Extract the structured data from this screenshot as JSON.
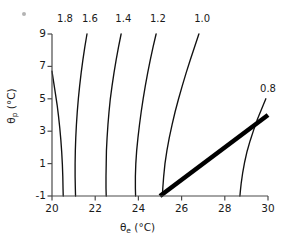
{
  "figure": {
    "background": "#ffffff",
    "line_color": "#111111",
    "axis_color": "#4a4a4a",
    "thick_line_color": "#000000",
    "artifact": {
      "name": "speck",
      "x": 22,
      "y": 12
    }
  },
  "axes": {
    "x": {
      "label_theta": "θ",
      "label_sub": "e",
      "label_unit": "(°C)",
      "ticks": [
        20,
        22,
        24,
        26,
        28,
        30
      ],
      "tick_labels": [
        "20",
        "22",
        "24",
        "26",
        "28",
        "30"
      ],
      "min": 20,
      "max": 30
    },
    "y": {
      "label_theta": "θ",
      "label_sub": "p",
      "label_unit": "(°C)",
      "ticks": [
        -1,
        1,
        3,
        5,
        7,
        9
      ],
      "tick_labels": [
        "-1",
        "1",
        "3",
        "5",
        "7",
        "9"
      ],
      "min": -1,
      "max": 9
    }
  },
  "chart_data": {
    "type": "line",
    "title": "",
    "xlabel": "θe (°C)",
    "ylabel": "θp (°C)",
    "xlim": [
      20,
      30
    ],
    "ylim": [
      -1,
      9
    ],
    "grid": false,
    "legend": "inline-contour-labels",
    "xticks": [
      20,
      22,
      24,
      26,
      28,
      30
    ],
    "yticks": [
      -1,
      1,
      3,
      5,
      7,
      9
    ],
    "series": [
      {
        "name": "1.8",
        "label": "1.8",
        "label_pos": {
          "x": 20.65,
          "y": 9.95
        },
        "points": [
          [
            20.0,
            6.7
          ],
          [
            20.08,
            6.0
          ],
          [
            20.16,
            5.3
          ],
          [
            20.24,
            4.6
          ],
          [
            20.3,
            3.95
          ],
          [
            20.36,
            3.2
          ],
          [
            20.41,
            2.45
          ],
          [
            20.45,
            1.7
          ],
          [
            20.48,
            0.95
          ],
          [
            20.5,
            0.2
          ],
          [
            20.51,
            -0.5
          ],
          [
            20.52,
            -1.0
          ]
        ]
      },
      {
        "name": "1.6",
        "label": "1.6",
        "label_pos": {
          "x": 21.8,
          "y": 9.95
        },
        "points": [
          [
            21.62,
            9.0
          ],
          [
            21.52,
            8.2
          ],
          [
            21.43,
            7.4
          ],
          [
            21.35,
            6.6
          ],
          [
            21.28,
            5.8
          ],
          [
            21.22,
            5.0
          ],
          [
            21.17,
            4.2
          ],
          [
            21.13,
            3.4
          ],
          [
            21.1,
            2.6
          ],
          [
            21.08,
            1.8
          ],
          [
            21.07,
            1.0
          ],
          [
            21.07,
            0.2
          ],
          [
            21.08,
            -0.5
          ],
          [
            21.09,
            -1.0
          ]
        ]
      },
      {
        "name": "1.4",
        "label": "1.4",
        "label_pos": {
          "x": 23.35,
          "y": 9.95
        },
        "points": [
          [
            23.2,
            9.0
          ],
          [
            23.08,
            8.2
          ],
          [
            22.97,
            7.4
          ],
          [
            22.87,
            6.6
          ],
          [
            22.78,
            5.8
          ],
          [
            22.7,
            5.0
          ],
          [
            22.64,
            4.2
          ],
          [
            22.59,
            3.4
          ],
          [
            22.55,
            2.6
          ],
          [
            22.52,
            1.8
          ],
          [
            22.51,
            1.0
          ],
          [
            22.5,
            0.2
          ],
          [
            22.5,
            -0.5
          ],
          [
            22.51,
            -1.0
          ]
        ]
      },
      {
        "name": "1.2",
        "label": "1.2",
        "label_pos": {
          "x": 24.95,
          "y": 9.95
        },
        "points": [
          [
            24.82,
            9.0
          ],
          [
            24.68,
            8.2
          ],
          [
            24.55,
            7.4
          ],
          [
            24.43,
            6.6
          ],
          [
            24.32,
            5.8
          ],
          [
            24.22,
            5.0
          ],
          [
            24.13,
            4.2
          ],
          [
            24.05,
            3.4
          ],
          [
            23.98,
            2.6
          ],
          [
            23.92,
            1.8
          ],
          [
            23.88,
            1.0
          ],
          [
            23.86,
            0.2
          ],
          [
            23.86,
            -0.5
          ],
          [
            23.87,
            -1.0
          ]
        ]
      },
      {
        "name": "1.0",
        "label": "1.0",
        "label_pos": {
          "x": 27.0,
          "y": 9.95
        },
        "points": [
          [
            26.8,
            9.0
          ],
          [
            26.6,
            8.2
          ],
          [
            26.4,
            7.4
          ],
          [
            26.21,
            6.6
          ],
          [
            26.03,
            5.8
          ],
          [
            25.86,
            5.0
          ],
          [
            25.7,
            4.2
          ],
          [
            25.56,
            3.4
          ],
          [
            25.43,
            2.6
          ],
          [
            25.32,
            1.8
          ],
          [
            25.23,
            1.0
          ],
          [
            25.17,
            0.2
          ],
          [
            25.13,
            -0.5
          ],
          [
            25.11,
            -1.0
          ]
        ]
      },
      {
        "name": "0.8",
        "label": "0.8",
        "label_pos": {
          "x": 30.05,
          "y": 5.6
        },
        "points": [
          [
            29.9,
            5.0
          ],
          [
            29.7,
            4.35
          ],
          [
            29.5,
            3.7
          ],
          [
            29.33,
            3.05
          ],
          [
            29.17,
            2.4
          ],
          [
            29.03,
            1.75
          ],
          [
            28.92,
            1.1
          ],
          [
            28.83,
            0.45
          ],
          [
            28.76,
            -0.2
          ],
          [
            28.72,
            -0.7
          ],
          [
            28.7,
            -1.0
          ]
        ]
      }
    ],
    "thick_line": {
      "name": "saturation-line",
      "label": "",
      "width_px": 4.6,
      "points": [
        [
          25.0,
          -1.0
        ],
        [
          30.0,
          4.0
        ]
      ]
    }
  }
}
